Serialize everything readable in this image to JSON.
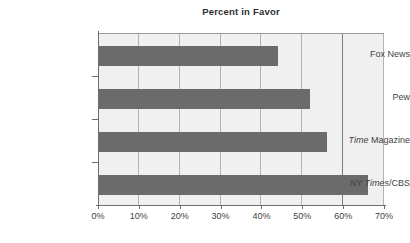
{
  "chart_data": {
    "type": "bar",
    "orientation": "horizontal",
    "title": "Percent in Favor",
    "xlabel": "",
    "ylabel": "",
    "categories": [
      "Fox News",
      "Pew",
      "Time Magazine",
      "NY Times/CBS"
    ],
    "values": [
      44,
      52,
      56,
      66
    ],
    "xlim": [
      0,
      70
    ],
    "xticks": [
      0,
      10,
      20,
      30,
      40,
      50,
      60,
      70
    ],
    "xtick_labels": [
      "0%",
      "10%",
      "20%",
      "30%",
      "40%",
      "50%",
      "60%",
      "70%"
    ],
    "grid": true,
    "legend": null,
    "bar_color": "#6b6b6b",
    "plot_background": "#f0f0f0",
    "category_label_parts": [
      [
        {
          "text": "Fox News",
          "style": "normal"
        }
      ],
      [
        {
          "text": "Pew",
          "style": "normal"
        }
      ],
      [
        {
          "text": "Time ",
          "style": "italic"
        },
        {
          "text": "Magazine",
          "style": "normal"
        }
      ],
      [
        {
          "text": "NY Times",
          "style": "italic"
        },
        {
          "text": "/CBS",
          "style": "normal"
        }
      ]
    ]
  }
}
